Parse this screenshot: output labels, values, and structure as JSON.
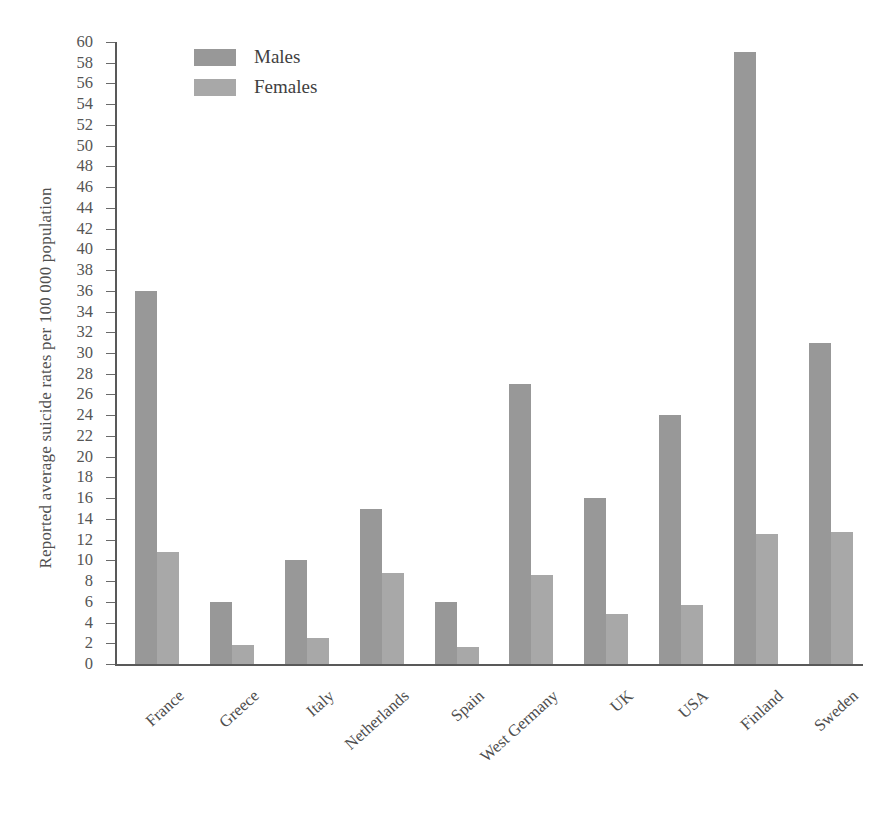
{
  "chart_data": {
    "type": "bar",
    "title": "",
    "xlabel": "",
    "ylabel": "Reported average suicide rates per 100 000 population",
    "ylim": [
      0,
      60
    ],
    "ytick_step": 2,
    "yticks": [
      0,
      2,
      4,
      6,
      8,
      10,
      12,
      14,
      16,
      18,
      20,
      22,
      24,
      26,
      28,
      30,
      32,
      34,
      36,
      38,
      40,
      42,
      44,
      46,
      48,
      50,
      52,
      54,
      56,
      58,
      60
    ],
    "grid": false,
    "legend_position": "top-left",
    "categories": [
      "France",
      "Greece",
      "Italy",
      "Netherlands",
      "Spain",
      "West Germany",
      "UK",
      "USA",
      "Finland",
      "Sweden"
    ],
    "series": [
      {
        "name": "Males",
        "color": "#989898",
        "values": [
          36,
          6,
          10,
          15,
          6,
          27,
          16,
          24,
          59,
          31
        ]
      },
      {
        "name": "Females",
        "color": "#a8a8a8",
        "values": [
          10.8,
          1.8,
          2.5,
          8.8,
          1.6,
          8.6,
          4.8,
          5.7,
          12.5,
          12.7
        ]
      }
    ]
  },
  "legend": {
    "items": [
      {
        "label": "Males",
        "swatch": "males-swatch"
      },
      {
        "label": "Females",
        "swatch": "females-swatch"
      }
    ]
  }
}
